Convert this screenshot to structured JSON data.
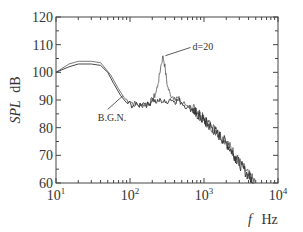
{
  "chart_data": {
    "type": "line",
    "title": "",
    "xlabel": "f  Hz",
    "xlabel_italic": "f",
    "xlabel_unit": "Hz",
    "ylabel": "SPL dB",
    "ylabel_italic": "SPL",
    "ylabel_unit": "dB",
    "xscale": "log",
    "xlim": [
      10,
      10000
    ],
    "ylim": [
      60,
      120
    ],
    "xticks": [
      10,
      100,
      1000,
      10000
    ],
    "xtick_labels": [
      {
        "base": "10",
        "exp": "1"
      },
      {
        "base": "10",
        "exp": "2"
      },
      {
        "base": "10",
        "exp": "3"
      },
      {
        "base": "10",
        "exp": "4"
      }
    ],
    "yticks": [
      60,
      70,
      80,
      90,
      100,
      110,
      120
    ],
    "ytick_labels": [
      "60",
      "70",
      "80",
      "90",
      "100",
      "110",
      "120"
    ],
    "grid": false,
    "legend": null,
    "series": [
      {
        "name": "d=20",
        "color": "#555555",
        "points": [
          [
            10,
            100
          ],
          [
            15,
            103
          ],
          [
            20,
            104
          ],
          [
            30,
            104
          ],
          [
            40,
            103.5
          ],
          [
            55,
            99
          ],
          [
            70,
            94
          ],
          [
            85,
            90.5
          ],
          [
            100,
            89.5
          ],
          [
            120,
            88.5
          ],
          [
            140,
            88
          ],
          [
            160,
            88.5
          ],
          [
            180,
            89
          ],
          [
            200,
            90
          ],
          [
            220,
            92
          ],
          [
            240,
            96
          ],
          [
            260,
            102
          ],
          [
            280,
            106
          ],
          [
            300,
            101
          ],
          [
            320,
            95
          ],
          [
            350,
            92
          ],
          [
            400,
            91
          ],
          [
            450,
            90.5
          ],
          [
            500,
            89
          ],
          [
            600,
            88
          ],
          [
            700,
            87
          ],
          [
            800,
            85.5
          ],
          [
            1000,
            83
          ],
          [
            1200,
            81
          ],
          [
            1500,
            78.5
          ],
          [
            2000,
            75
          ],
          [
            2500,
            71
          ],
          [
            3000,
            67.5
          ],
          [
            4000,
            63
          ],
          [
            5000,
            60
          ]
        ]
      },
      {
        "name": "B.G.N.",
        "color": "#333333",
        "points": [
          [
            10,
            100
          ],
          [
            15,
            102
          ],
          [
            20,
            103
          ],
          [
            30,
            103
          ],
          [
            40,
            102.5
          ],
          [
            50,
            100
          ],
          [
            60,
            96
          ],
          [
            75,
            91.5
          ],
          [
            90,
            89
          ],
          [
            110,
            88
          ],
          [
            130,
            88
          ],
          [
            150,
            89
          ],
          [
            180,
            88
          ],
          [
            200,
            90.5
          ],
          [
            230,
            89
          ],
          [
            260,
            90
          ],
          [
            300,
            89
          ],
          [
            350,
            90.5
          ],
          [
            400,
            89.5
          ],
          [
            450,
            90
          ],
          [
            500,
            89
          ],
          [
            600,
            87.5
          ],
          [
            700,
            86.5
          ],
          [
            800,
            85
          ],
          [
            1000,
            82.5
          ],
          [
            1200,
            80.5
          ],
          [
            1500,
            78
          ],
          [
            2000,
            74.5
          ],
          [
            2500,
            70.5
          ],
          [
            3000,
            67
          ],
          [
            4000,
            62.5
          ],
          [
            4800,
            60
          ]
        ]
      }
    ],
    "annotations": [
      {
        "text": "d=20",
        "x": 300,
        "y": 106,
        "label_x": 700,
        "label_y": 109
      },
      {
        "text": "B.G.N.",
        "x": 80,
        "y": 91.5,
        "label_x": 50,
        "label_y": 83
      }
    ]
  }
}
